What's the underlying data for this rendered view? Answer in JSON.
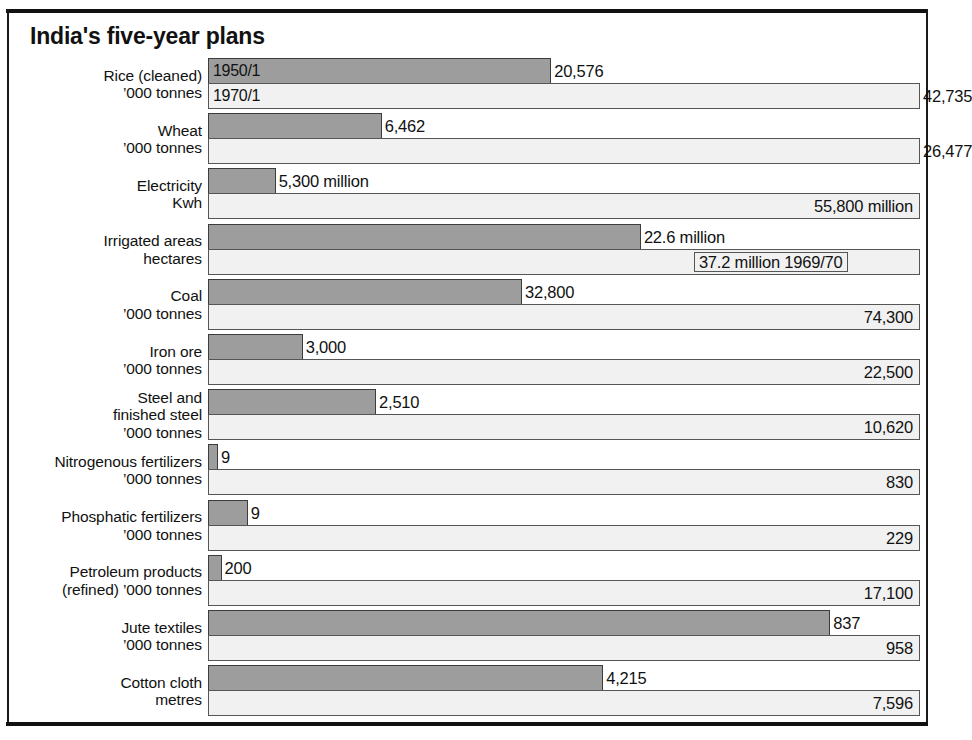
{
  "title": "India's five-year plans",
  "series_labels": {
    "old": "1950/1",
    "new": "1970/1"
  },
  "chart_data": {
    "type": "bar",
    "title": "India's five-year plans",
    "xlabel": "",
    "ylabel": "",
    "orientation": "horizontal",
    "grid": false,
    "legend_position": "inline-first-row",
    "note": "Each row is scaled independently: the 1970/1 bar spans the full plot width and the 1950/1 bar is drawn in proportion to it.",
    "series": [
      {
        "name": "1950/1",
        "values": [
          20576,
          6462,
          5300,
          22.6,
          32800,
          3000,
          2510,
          9,
          9,
          200,
          837,
          4215
        ]
      },
      {
        "name": "1970/1",
        "values": [
          42735,
          26477,
          55800,
          37.2,
          74300,
          22500,
          10620,
          830,
          229,
          17100,
          958,
          7596
        ]
      }
    ],
    "categories": [
      "Rice (cleaned) '000 tonnes",
      "Wheat '000 tonnes",
      "Electricity Kwh",
      "Irrigated areas hectares",
      "Coal '000 tonnes",
      "Iron ore '000 tonnes",
      "Steel and finished steel '000 tonnes",
      "Nitrogenous fertilizers '000 tonnes",
      "Phosphatic fertilizers '000 tonnes",
      "Petroleum products (refined) '000 tonnes",
      "Jute textiles '000 tonnes",
      "Cotton cloth metres"
    ]
  },
  "rows": [
    {
      "label_line1": "Rice (cleaned)",
      "label_line2": "’000 tonnes",
      "old_label": "20,576",
      "new_label": "42,735",
      "old_pct": 48.2,
      "new_pct": 100,
      "old_text_pos": "outside",
      "new_text_pos": "outside",
      "old_year_tag": "1950/1",
      "new_year_tag": "1970/1"
    },
    {
      "label_line1": "Wheat",
      "label_line2": "’000 tonnes",
      "old_label": "6,462",
      "new_label": "26,477",
      "old_pct": 24.4,
      "new_pct": 100,
      "old_text_pos": "outside",
      "new_text_pos": "outside",
      "old_year_tag": "",
      "new_year_tag": ""
    },
    {
      "label_line1": "Electricity",
      "label_line2": "Kwh",
      "old_label": "5,300 million",
      "new_label": "55,800 million",
      "old_pct": 9.5,
      "new_pct": 100,
      "old_text_pos": "outside",
      "new_text_pos": "inside",
      "old_year_tag": "",
      "new_year_tag": ""
    },
    {
      "label_line1": "Irrigated areas",
      "label_line2": "hectares",
      "old_label": "22.6 million",
      "new_label": "37.2 million 1969/70",
      "old_pct": 60.8,
      "new_pct": 100,
      "old_text_pos": "outside",
      "new_text_pos": "inside-left",
      "old_year_tag": "",
      "new_year_tag": ""
    },
    {
      "label_line1": "Coal",
      "label_line2": "’000 tonnes",
      "old_label": "32,800",
      "new_label": "74,300",
      "old_pct": 44.1,
      "new_pct": 100,
      "old_text_pos": "outside",
      "new_text_pos": "inside",
      "old_year_tag": "",
      "new_year_tag": ""
    },
    {
      "label_line1": "Iron ore",
      "label_line2": "’000 tonnes",
      "old_label": "3,000",
      "new_label": "22,500",
      "old_pct": 13.3,
      "new_pct": 100,
      "old_text_pos": "outside",
      "new_text_pos": "inside",
      "old_year_tag": "",
      "new_year_tag": ""
    },
    {
      "label_line1": "Steel and",
      "label_line2": "finished steel",
      "label_line3": "’000 tonnes",
      "old_label": "2,510",
      "new_label": "10,620",
      "old_pct": 23.6,
      "new_pct": 100,
      "old_text_pos": "outside",
      "new_text_pos": "inside",
      "old_year_tag": "",
      "new_year_tag": ""
    },
    {
      "label_line1": "Nitrogenous fertilizers",
      "label_line2": "’000 tonnes",
      "old_label": "9",
      "new_label": "830",
      "old_pct": 1.1,
      "new_pct": 100,
      "old_text_pos": "outside",
      "new_text_pos": "inside",
      "old_year_tag": "",
      "new_year_tag": ""
    },
    {
      "label_line1": "Phosphatic fertilizers",
      "label_line2": "’000 tonnes",
      "old_label": "9",
      "new_label": "229",
      "old_pct": 5.6,
      "new_pct": 100,
      "old_text_pos": "outside",
      "new_text_pos": "inside",
      "old_year_tag": "",
      "new_year_tag": ""
    },
    {
      "label_line1": "Petroleum products",
      "label_line2": "(refined) ’000 tonnes",
      "old_label": "200",
      "new_label": "17,100",
      "old_pct": 1.9,
      "new_pct": 100,
      "old_text_pos": "outside",
      "new_text_pos": "inside",
      "old_year_tag": "",
      "new_year_tag": ""
    },
    {
      "label_line1": "Jute textiles",
      "label_line2": "’000 tonnes",
      "old_label": "837",
      "new_label": "958",
      "old_pct": 87.4,
      "new_pct": 100,
      "old_text_pos": "outside",
      "new_text_pos": "inside",
      "old_year_tag": "",
      "new_year_tag": ""
    },
    {
      "label_line1": "Cotton cloth",
      "label_line2": "metres",
      "old_label": "4,215",
      "new_label": "7,596",
      "old_pct": 55.5,
      "new_pct": 100,
      "old_text_pos": "outside",
      "new_text_pos": "inside",
      "old_year_tag": "",
      "new_year_tag": ""
    }
  ],
  "colors": {
    "old_bar": "#9d9d9d",
    "new_bar": "#f1f1f1",
    "ink": "#111111",
    "page": "#ffffff"
  }
}
